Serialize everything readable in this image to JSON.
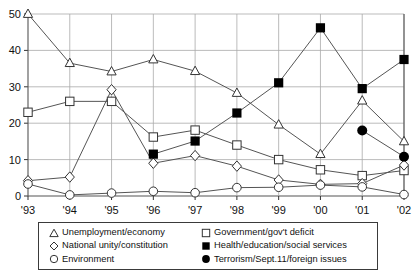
{
  "chart_data": {
    "type": "line",
    "title": "",
    "xlabel": "",
    "ylabel": "",
    "x": [
      "'93",
      "'94",
      "'95",
      "'96",
      "'97",
      "'98",
      "'99",
      "'00",
      "'01",
      "'02"
    ],
    "ylim": [
      0,
      50
    ],
    "yticks": [
      0,
      10,
      20,
      30,
      40,
      50
    ],
    "grid": true,
    "legend_position": "below-plot",
    "series": [
      {
        "name": "Unemployment/economy",
        "marker": "open-triangle",
        "color": "#555555",
        "values": [
          50,
          36.5,
          34.2,
          37.5,
          34.3,
          28.3,
          19.6,
          11.5,
          26.2,
          15
        ]
      },
      {
        "name": "Government/gov't deficit",
        "marker": "open-square",
        "color": "#555555",
        "values": [
          23,
          26,
          26,
          16.2,
          18.1,
          14,
          10,
          7.2,
          5.6,
          7
        ]
      },
      {
        "name": "National unity/constitution",
        "marker": "open-diamond",
        "color": "#555555",
        "values": [
          4.2,
          5.2,
          29.2,
          9,
          11.1,
          8.2,
          4.4,
          3.2,
          3.4,
          8.5
        ]
      },
      {
        "name": "Health/education/social services",
        "marker": "filled-square",
        "color": "#000000",
        "values": [
          null,
          null,
          null,
          11.5,
          15.1,
          22.8,
          31.1,
          46.2,
          29.5,
          37.5
        ]
      },
      {
        "name": "Environment",
        "marker": "open-circle",
        "color": "#555555",
        "values": [
          3.3,
          0.3,
          0.8,
          1.3,
          0.9,
          2.3,
          2.4,
          3,
          2.5,
          0.4
        ]
      },
      {
        "name": "Terrorism/Sept.11/foreign issues",
        "marker": "filled-circle",
        "color": "#000000",
        "values": [
          null,
          null,
          null,
          null,
          null,
          null,
          null,
          null,
          18,
          10.8
        ]
      }
    ]
  },
  "legend": {
    "items": [
      {
        "label": "Unemployment/economy",
        "marker": "open-triangle"
      },
      {
        "label": "Government/gov't deficit",
        "marker": "open-square"
      },
      {
        "label": "National unity/constitution",
        "marker": "open-diamond"
      },
      {
        "label": "Health/education/social services",
        "marker": "filled-square"
      },
      {
        "label": "Environment",
        "marker": "open-circle"
      },
      {
        "label": "Terrorism/Sept.11/foreign issues",
        "marker": "filled-circle"
      }
    ]
  }
}
